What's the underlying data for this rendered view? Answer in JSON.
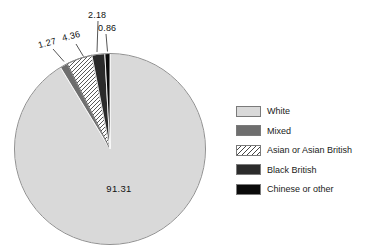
{
  "figure": {
    "background": "#ffffff",
    "title": ""
  },
  "chart_data": {
    "type": "pie",
    "title": "",
    "unit": "percent",
    "start_angle_deg": 0,
    "direction": "clockwise",
    "outline_color": "#8f8f8f",
    "label_color": "#111111",
    "leader_line_color": "#2b2b2b",
    "legend_position": "right",
    "slices": [
      {
        "label": "White",
        "value": 91.31,
        "display": "91.31",
        "color": "#d9d9d9",
        "pattern": "solid"
      },
      {
        "label": "Mixed",
        "value": 1.27,
        "display": "1.27",
        "color": "#6e6e6e",
        "pattern": "solid"
      },
      {
        "label": "Asian or Asian British",
        "value": 4.36,
        "display": "4.36",
        "color": "#ffffff",
        "pattern": "hatch",
        "hatch_line_color": "#454545"
      },
      {
        "label": "Black British",
        "value": 2.18,
        "display": "2.18",
        "color": "#2b2b2b",
        "pattern": "solid"
      },
      {
        "label": "Chinese or other",
        "value": 0.86,
        "display": "0.86",
        "color": "#0a0a0a",
        "pattern": "solid"
      }
    ]
  }
}
